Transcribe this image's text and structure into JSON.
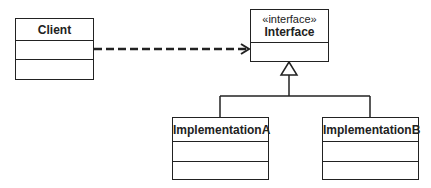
{
  "diagram": {
    "type": "UML class diagram",
    "classes": [
      {
        "id": "client",
        "name": "Client",
        "stereotype": null
      },
      {
        "id": "interface",
        "name": "Interface",
        "stereotype": "«interface»"
      },
      {
        "id": "implA",
        "name": "ImplementationA",
        "stereotype": null
      },
      {
        "id": "implB",
        "name": "ImplementationB",
        "stereotype": null
      }
    ],
    "relationships": [
      {
        "from": "Client",
        "to": "Interface",
        "kind": "dependency",
        "style": "dashed open arrow"
      },
      {
        "from": "ImplementationA",
        "to": "Interface",
        "kind": "realization",
        "style": "hollow triangle"
      },
      {
        "from": "ImplementationB",
        "to": "Interface",
        "kind": "realization",
        "style": "hollow triangle"
      }
    ],
    "colors": {
      "line": "#222222",
      "background": "#ffffff"
    }
  }
}
